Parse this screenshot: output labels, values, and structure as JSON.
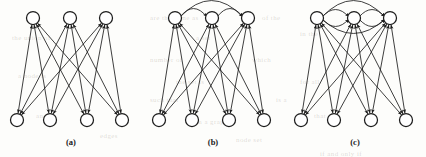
{
  "figure": {
    "width": 426,
    "height": 157,
    "background_color": "#fdfdfb",
    "ink_color": "#1c1c1c",
    "node_fill": "#ffffff",
    "node_radius": 6.5,
    "top_row_y": 18,
    "bottom_row_y": 120,
    "label_y": 145
  },
  "panels": [
    {
      "id": "a",
      "label": "(a)",
      "label_x": 71,
      "origin_x": 0,
      "top_nodes": [
        {
          "name": "top-node-1",
          "x": 33
        },
        {
          "name": "top-node-2",
          "x": 70
        },
        {
          "name": "top-node-3",
          "x": 106
        }
      ],
      "bottom_nodes": [
        {
          "name": "bottom-node-1",
          "x": 17
        },
        {
          "name": "bottom-node-2",
          "x": 50
        },
        {
          "name": "bottom-node-3",
          "x": 87
        },
        {
          "name": "bottom-node-4",
          "x": 122
        }
      ],
      "cross_edges": [
        [
          0,
          0
        ],
        [
          0,
          1
        ],
        [
          0,
          2
        ],
        [
          0,
          3
        ],
        [
          1,
          0
        ],
        [
          1,
          1
        ],
        [
          1,
          2
        ],
        [
          1,
          3
        ],
        [
          2,
          0
        ],
        [
          2,
          1
        ],
        [
          2,
          2
        ],
        [
          2,
          3
        ]
      ],
      "top_arcs": []
    },
    {
      "id": "b",
      "label": "(b)",
      "label_x": 213,
      "origin_x": 142,
      "top_nodes": [
        {
          "name": "top-node-1",
          "x": 33
        },
        {
          "name": "top-node-2",
          "x": 70
        },
        {
          "name": "top-node-3",
          "x": 106
        }
      ],
      "bottom_nodes": [
        {
          "name": "bottom-node-1",
          "x": 17
        },
        {
          "name": "bottom-node-2",
          "x": 50
        },
        {
          "name": "bottom-node-3",
          "x": 87
        },
        {
          "name": "bottom-node-4",
          "x": 122
        }
      ],
      "cross_edges": [
        [
          0,
          0
        ],
        [
          0,
          1
        ],
        [
          0,
          2
        ],
        [
          0,
          3
        ],
        [
          1,
          0
        ],
        [
          1,
          1
        ],
        [
          1,
          2
        ],
        [
          1,
          3
        ],
        [
          2,
          0
        ],
        [
          2,
          1
        ],
        [
          2,
          2
        ],
        [
          2,
          3
        ]
      ],
      "top_arcs": [
        {
          "name": "arc-top-1-2",
          "from": 0,
          "to": 1,
          "side": "above",
          "lift": 9
        },
        {
          "name": "arc-top-2-3",
          "from": 1,
          "to": 2,
          "side": "above",
          "lift": 9
        },
        {
          "name": "arc-top-1-3",
          "from": 0,
          "to": 2,
          "side": "above",
          "lift": 17
        }
      ]
    },
    {
      "id": "c",
      "label": "(c)",
      "label_x": 355,
      "origin_x": 284,
      "top_nodes": [
        {
          "name": "top-node-1",
          "x": 33
        },
        {
          "name": "top-node-2",
          "x": 70
        },
        {
          "name": "top-node-3",
          "x": 106
        }
      ],
      "bottom_nodes": [
        {
          "name": "bottom-node-1",
          "x": 17
        },
        {
          "name": "bottom-node-2",
          "x": 50
        },
        {
          "name": "bottom-node-3",
          "x": 87
        },
        {
          "name": "bottom-node-4",
          "x": 122
        }
      ],
      "cross_edges": [
        [
          0,
          0
        ],
        [
          0,
          1
        ],
        [
          0,
          2
        ],
        [
          0,
          3
        ],
        [
          1,
          0
        ],
        [
          1,
          1
        ],
        [
          1,
          2
        ],
        [
          1,
          3
        ],
        [
          2,
          0
        ],
        [
          2,
          1
        ],
        [
          2,
          2
        ],
        [
          2,
          3
        ]
      ],
      "top_arcs": [
        {
          "name": "arc-top-1-2-above",
          "from": 0,
          "to": 1,
          "side": "above",
          "lift": 8
        },
        {
          "name": "arc-top-1-2-below",
          "from": 0,
          "to": 1,
          "side": "below",
          "lift": 8
        },
        {
          "name": "arc-top-2-3-above",
          "from": 1,
          "to": 2,
          "side": "above",
          "lift": 8
        },
        {
          "name": "arc-top-2-3-below",
          "from": 1,
          "to": 2,
          "side": "below",
          "lift": 8
        },
        {
          "name": "arc-top-1-3-above",
          "from": 0,
          "to": 2,
          "side": "above",
          "lift": 17
        },
        {
          "name": "arc-top-1-3-below",
          "from": 0,
          "to": 2,
          "side": "below",
          "lift": 15
        }
      ]
    }
  ],
  "bleed_text": [
    {
      "text": "are the same as",
      "x": 150,
      "y": 14
    },
    {
      "text": "of the",
      "x": 262,
      "y": 14
    },
    {
      "text": "the union of",
      "x": 12,
      "y": 34
    },
    {
      "text": "a set",
      "x": 196,
      "y": 34
    },
    {
      "text": "in the",
      "x": 300,
      "y": 30
    },
    {
      "text": "number of",
      "x": 150,
      "y": 56
    },
    {
      "text": "which",
      "x": 252,
      "y": 56
    },
    {
      "text": "a node is",
      "x": 18,
      "y": 72
    },
    {
      "text": "the set is",
      "x": 176,
      "y": 78
    },
    {
      "text": "for all",
      "x": 300,
      "y": 78
    },
    {
      "text": "such that",
      "x": 150,
      "y": 96
    },
    {
      "text": "is a",
      "x": 276,
      "y": 96
    },
    {
      "text": "and",
      "x": 36,
      "y": 112
    },
    {
      "text": "in a graph",
      "x": 196,
      "y": 118
    },
    {
      "text": "that",
      "x": 314,
      "y": 112
    },
    {
      "text": "edges",
      "x": 100,
      "y": 132
    },
    {
      "text": "node set",
      "x": 236,
      "y": 136
    },
    {
      "text": "if and only if",
      "x": 320,
      "y": 150
    }
  ]
}
